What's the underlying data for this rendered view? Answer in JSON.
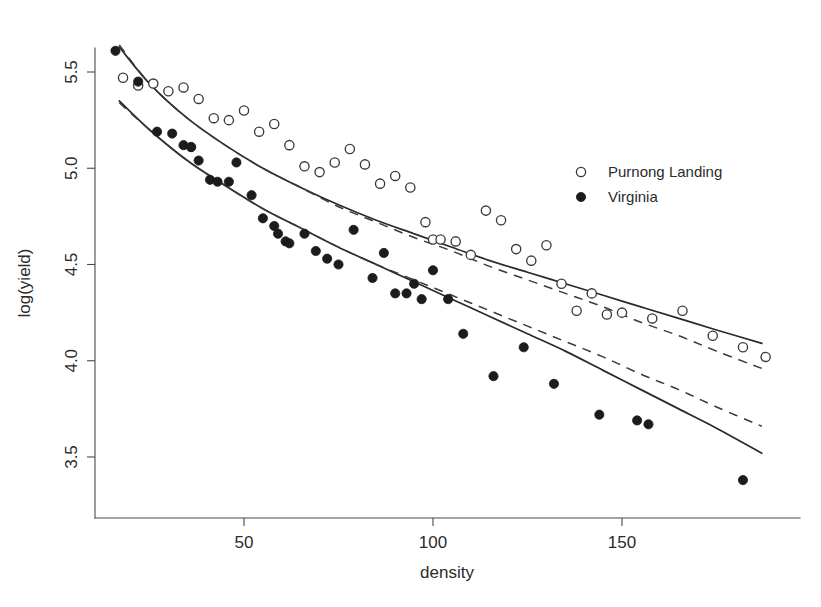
{
  "figure": {
    "background_color": "#ffffff",
    "foreground_color": "#2b2b2b",
    "width": 821,
    "height": 607
  },
  "legend": {
    "position": "right-upper",
    "entries": [
      {
        "label": "Purnong Landing",
        "marker": "open-circle",
        "color": "#3a3a3a"
      },
      {
        "label": "Virginia",
        "marker": "filled-circle",
        "color": "#1c1c1c"
      }
    ]
  },
  "axes": {
    "x": {
      "label": "density",
      "ticks": [
        50,
        100,
        150
      ],
      "tick_labels": [
        "50",
        "100",
        "150"
      ],
      "range": [
        13,
        190
      ]
    },
    "y": {
      "label": "log(yield)",
      "ticks": [
        3.5,
        4.0,
        4.5,
        5.0,
        5.5
      ],
      "tick_labels": [
        "3.5",
        "4.0",
        "4.5",
        "5.0",
        "5.5"
      ],
      "range": [
        3.28,
        5.72
      ]
    }
  },
  "chart_data": {
    "type": "scatter",
    "title": "",
    "xlabel": "density",
    "ylabel": "log(yield)",
    "xlim": [
      13,
      190
    ],
    "ylim": [
      3.28,
      5.72
    ],
    "grid": false,
    "legend_position": "right-upper",
    "series": [
      {
        "name": "Purnong Landing",
        "marker": "open-circle",
        "color": "#3a3a3a",
        "x": [
          18,
          22,
          26,
          30,
          34,
          38,
          42,
          46,
          50,
          54,
          58,
          62,
          66,
          70,
          74,
          78,
          82,
          86,
          90,
          94,
          98,
          100,
          102,
          106,
          110,
          114,
          118,
          122,
          126,
          130,
          134,
          138,
          142,
          146,
          150,
          158,
          166,
          174,
          182,
          188
        ],
        "y": [
          5.47,
          5.43,
          5.44,
          5.4,
          5.42,
          5.36,
          5.26,
          5.25,
          5.3,
          5.19,
          5.23,
          5.12,
          5.01,
          4.98,
          5.03,
          5.1,
          5.02,
          4.92,
          4.96,
          4.9,
          4.72,
          4.63,
          4.63,
          4.62,
          4.55,
          4.78,
          4.73,
          4.58,
          4.52,
          4.6,
          4.4,
          4.26,
          4.35,
          4.24,
          4.25,
          4.22,
          4.26,
          4.13,
          4.07,
          4.02
        ]
      },
      {
        "name": "Virginia",
        "marker": "filled-circle",
        "color": "#1c1c1c",
        "x": [
          16,
          22,
          27,
          31,
          34,
          36,
          36,
          38,
          41,
          43,
          46,
          48,
          52,
          55,
          58,
          59,
          61,
          62,
          66,
          69,
          72,
          75,
          79,
          84,
          87,
          90,
          93,
          95,
          97,
          100,
          104,
          108,
          116,
          124,
          132,
          144,
          154,
          157,
          182
        ],
        "y": [
          5.61,
          5.45,
          5.19,
          5.18,
          5.12,
          5.11,
          5.11,
          5.04,
          4.94,
          4.93,
          4.93,
          5.03,
          4.86,
          4.74,
          4.7,
          4.66,
          4.62,
          4.61,
          4.66,
          4.57,
          4.53,
          4.5,
          4.68,
          4.43,
          4.56,
          4.35,
          4.35,
          4.4,
          4.32,
          4.47,
          4.32,
          4.14,
          3.92,
          4.07,
          3.88,
          3.72,
          3.69,
          3.67,
          3.38
        ]
      }
    ],
    "fits": [
      {
        "name": "Purnong Landing fitted curve (solid)",
        "style": "solid",
        "series": "Purnong Landing",
        "points": [
          [
            17,
            5.63
          ],
          [
            25,
            5.44
          ],
          [
            35,
            5.26
          ],
          [
            45,
            5.12
          ],
          [
            55,
            5.0
          ],
          [
            65,
            4.9
          ],
          [
            75,
            4.81
          ],
          [
            85,
            4.73
          ],
          [
            95,
            4.66
          ],
          [
            105,
            4.59
          ],
          [
            115,
            4.52
          ],
          [
            125,
            4.46
          ],
          [
            135,
            4.4
          ],
          [
            145,
            4.34
          ],
          [
            155,
            4.28
          ],
          [
            165,
            4.22
          ],
          [
            175,
            4.16
          ],
          [
            187,
            4.09
          ]
        ]
      },
      {
        "name": "Purnong Landing fitted curve (dashed)",
        "style": "dashed",
        "series": "Purnong Landing",
        "points": [
          [
            17,
            5.64
          ],
          [
            25,
            5.44
          ],
          [
            35,
            5.26
          ],
          [
            45,
            5.12
          ],
          [
            55,
            5.0
          ],
          [
            65,
            4.9
          ],
          [
            75,
            4.8
          ],
          [
            85,
            4.72
          ],
          [
            95,
            4.64
          ],
          [
            105,
            4.57
          ],
          [
            115,
            4.49
          ],
          [
            125,
            4.42
          ],
          [
            135,
            4.35
          ],
          [
            145,
            4.28
          ],
          [
            155,
            4.2
          ],
          [
            165,
            4.13
          ],
          [
            175,
            4.05
          ],
          [
            187,
            3.96
          ]
        ]
      },
      {
        "name": "Virginia fitted curve (solid)",
        "style": "solid",
        "series": "Virginia",
        "points": [
          [
            17,
            5.35
          ],
          [
            25,
            5.2
          ],
          [
            35,
            5.04
          ],
          [
            45,
            4.91
          ],
          [
            55,
            4.79
          ],
          [
            65,
            4.69
          ],
          [
            75,
            4.59
          ],
          [
            85,
            4.5
          ],
          [
            95,
            4.41
          ],
          [
            105,
            4.32
          ],
          [
            115,
            4.23
          ],
          [
            125,
            4.14
          ],
          [
            135,
            4.05
          ],
          [
            145,
            3.95
          ],
          [
            155,
            3.85
          ],
          [
            165,
            3.75
          ],
          [
            175,
            3.65
          ],
          [
            187,
            3.52
          ]
        ]
      },
      {
        "name": "Virginia fitted curve (dashed)",
        "style": "dashed",
        "series": "Virginia",
        "points": [
          [
            17,
            5.34
          ],
          [
            25,
            5.2
          ],
          [
            35,
            5.04
          ],
          [
            45,
            4.91
          ],
          [
            55,
            4.79
          ],
          [
            65,
            4.69
          ],
          [
            75,
            4.59
          ],
          [
            85,
            4.5
          ],
          [
            95,
            4.42
          ],
          [
            105,
            4.34
          ],
          [
            115,
            4.26
          ],
          [
            125,
            4.18
          ],
          [
            135,
            4.1
          ],
          [
            145,
            4.02
          ],
          [
            155,
            3.93
          ],
          [
            165,
            3.85
          ],
          [
            175,
            3.76
          ],
          [
            187,
            3.66
          ]
        ]
      }
    ]
  }
}
